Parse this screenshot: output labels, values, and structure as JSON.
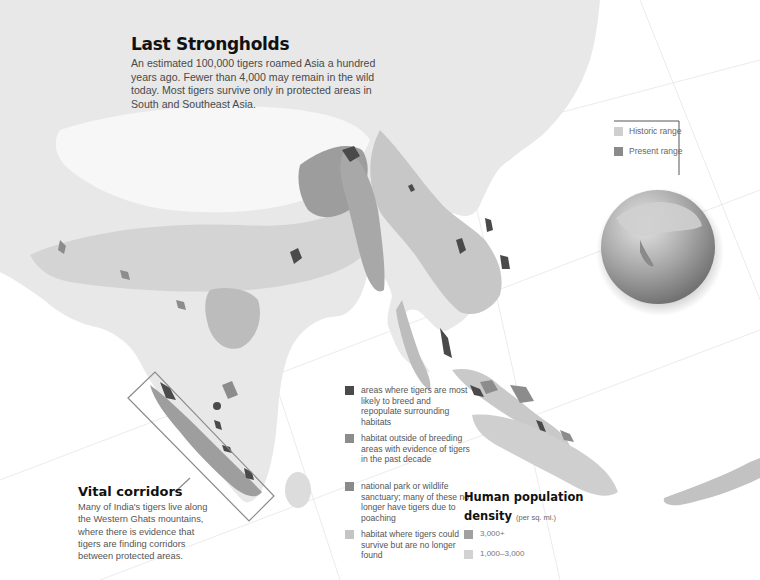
{
  "map": {
    "title": "Last Strongholds",
    "description": "An estimated 100,000 tigers roamed Asia a hundred years ago. Fewer than 4,000 may remain in the wild today. Most tigers survive only in protected areas in South and Southeast Asia.",
    "style": "grayscale shaded relief",
    "region": "South and Southeast Asia"
  },
  "callout": {
    "title": "Vital corridors",
    "description": "Many of India's tigers live along the Western Ghats mountains, where there is evidence that tigers are finding corridors between protected areas."
  },
  "habitat_legend": {
    "items": [
      {
        "label": "areas where tigers are most likely to breed and repopulate surrounding habitats",
        "color": "#4a4a4a"
      },
      {
        "label": "habitat outside of breeding areas with evidence of tigers in the past decade",
        "color": "#8c8c8c"
      },
      {
        "label": "national park or wildlife sanctuary; many of these no longer have tigers due to poaching",
        "color": "#8a8a8a"
      },
      {
        "label": "habitat where tigers could survive but are no longer found",
        "color": "#c4c4c4"
      }
    ]
  },
  "population_legend": {
    "title": "Human population density",
    "title_line1": "Human population",
    "title_line2": "density",
    "unit": "(per sq. mi.)",
    "items": [
      {
        "label": "3,000+",
        "color": "#a0a0a0"
      },
      {
        "label": "1,000–3,000",
        "color": "#d2d2d2"
      }
    ]
  },
  "range_legend": {
    "items": [
      {
        "label": "Historic range",
        "color": "#cfcfcf"
      },
      {
        "label": "Present range",
        "color": "#8a8a8a"
      }
    ]
  },
  "colors": {
    "ocean": "#ffffff",
    "land_light": "#e9e9e9",
    "land_mid": "#d0d0d0",
    "land_dark": "#a9a9a9",
    "breeding": "#4a4a4a",
    "callout_box": "#8a8a8a"
  }
}
